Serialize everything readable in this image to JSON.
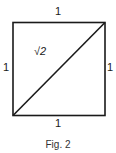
{
  "figure": {
    "caption": "Fig. 2",
    "labels": {
      "top": "1",
      "left": "1",
      "right": "1",
      "bottom": "1",
      "diagonal": "√2"
    },
    "shape": "square with diagonal from bottom-left to top-right"
  }
}
